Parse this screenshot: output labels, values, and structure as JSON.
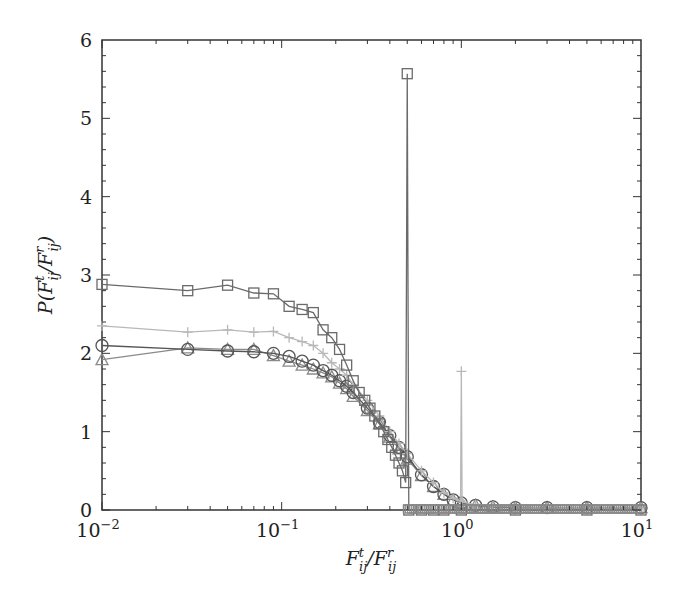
{
  "chart_data": {
    "type": "line",
    "title": "",
    "xlabel": "F_ij^t / F_ij^r",
    "ylabel": "P(F_ij^t / F_ij^r)",
    "xscale": "log",
    "xlim": [
      0.01,
      10
    ],
    "ylim": [
      0,
      6
    ],
    "grid": false,
    "legend": null,
    "x_tick_labels": [
      "10^-2",
      "10^-1",
      "10^0",
      "10^1"
    ],
    "y_tick_labels": [
      "0",
      "1",
      "2",
      "3",
      "4",
      "5",
      "6"
    ],
    "series": [
      {
        "name": "squares",
        "marker": "square",
        "color": "#6a6a6a",
        "x": [
          0.01,
          0.03,
          0.05,
          0.07,
          0.09,
          0.11,
          0.13,
          0.15,
          0.17,
          0.19,
          0.21,
          0.23,
          0.25,
          0.27,
          0.29,
          0.31,
          0.33,
          0.35,
          0.37,
          0.39,
          0.41,
          0.43,
          0.45,
          0.47,
          0.49,
          0.5,
          0.51,
          0.6,
          0.7,
          0.8,
          1.0,
          2.0,
          5.0,
          10.0
        ],
        "y": [
          2.88,
          2.8,
          2.87,
          2.77,
          2.76,
          2.6,
          2.56,
          2.52,
          2.3,
          2.2,
          2.05,
          1.85,
          1.65,
          1.5,
          1.4,
          1.3,
          1.2,
          1.1,
          1.0,
          0.9,
          0.8,
          0.7,
          0.6,
          0.5,
          0.35,
          5.57,
          0.0,
          0.0,
          0.0,
          0.0,
          0.0,
          0.0,
          0.0,
          0.0
        ]
      },
      {
        "name": "plus",
        "marker": "plus",
        "color": "#b8b8b8",
        "x": [
          0.01,
          0.03,
          0.05,
          0.07,
          0.09,
          0.11,
          0.13,
          0.15,
          0.17,
          0.19,
          0.21,
          0.23,
          0.25,
          0.3,
          0.35,
          0.4,
          0.45,
          0.5,
          0.6,
          0.7,
          0.8,
          0.9,
          0.99,
          1.0,
          1.01,
          1.2,
          1.5,
          2.0,
          3.0,
          5.0,
          10.0
        ],
        "y": [
          2.35,
          2.27,
          2.3,
          2.27,
          2.28,
          2.2,
          2.15,
          2.1,
          2.0,
          1.88,
          1.8,
          1.72,
          1.6,
          1.4,
          1.2,
          1.0,
          0.85,
          0.72,
          0.5,
          0.35,
          0.22,
          0.15,
          0.12,
          1.77,
          0.1,
          0.07,
          0.05,
          0.04,
          0.03,
          0.03,
          0.03
        ]
      },
      {
        "name": "circles",
        "marker": "circle",
        "color": "#555555",
        "x": [
          0.01,
          0.03,
          0.05,
          0.07,
          0.09,
          0.11,
          0.13,
          0.15,
          0.17,
          0.19,
          0.21,
          0.23,
          0.25,
          0.3,
          0.35,
          0.4,
          0.45,
          0.5,
          0.6,
          0.7,
          0.8,
          0.9,
          1.0,
          1.2,
          1.5,
          2.0,
          3.0,
          5.0,
          10.0
        ],
        "y": [
          2.1,
          2.05,
          2.03,
          2.02,
          2.0,
          1.96,
          1.9,
          1.85,
          1.78,
          1.72,
          1.65,
          1.58,
          1.5,
          1.3,
          1.12,
          0.95,
          0.8,
          0.68,
          0.45,
          0.3,
          0.2,
          0.13,
          0.09,
          0.06,
          0.04,
          0.03,
          0.03,
          0.03,
          0.03
        ]
      },
      {
        "name": "triangles",
        "marker": "triangle",
        "color": "#8a8a8a",
        "x": [
          0.01,
          0.03,
          0.05,
          0.07,
          0.09,
          0.11,
          0.13,
          0.15,
          0.17,
          0.19,
          0.21,
          0.23,
          0.25,
          0.3,
          0.35,
          0.4,
          0.45,
          0.5,
          0.6,
          0.7,
          0.8,
          0.9,
          1.0,
          1.2,
          1.5,
          2.0,
          3.0,
          5.0,
          10.0
        ],
        "y": [
          1.92,
          2.07,
          2.05,
          2.05,
          1.97,
          1.9,
          1.85,
          1.8,
          1.75,
          1.7,
          1.62,
          1.55,
          1.45,
          1.27,
          1.1,
          0.93,
          0.78,
          0.65,
          0.44,
          0.3,
          0.2,
          0.13,
          0.09,
          0.06,
          0.04,
          0.03,
          0.03,
          0.03,
          0.03
        ]
      }
    ]
  }
}
